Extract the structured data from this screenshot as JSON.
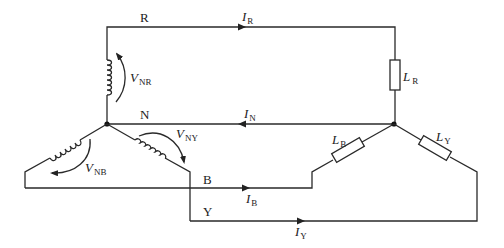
{
  "diagram": {
    "type": "three-phase star-connected supply with star-connected load and neutral",
    "lines": {
      "R": "R",
      "N": "N",
      "B": "B",
      "Y": "Y"
    },
    "currents": {
      "IR": {
        "main": "I",
        "sub": "R"
      },
      "IN": {
        "main": "I",
        "sub": "N"
      },
      "IB": {
        "main": "I",
        "sub": "B"
      },
      "IY": {
        "main": "I",
        "sub": "Y"
      }
    },
    "voltages": {
      "VNR": {
        "main": "V",
        "sub": "NR"
      },
      "VNY": {
        "main": "V",
        "sub": "NY"
      },
      "VNB": {
        "main": "V",
        "sub": "NB"
      }
    },
    "loads": {
      "LR": {
        "main": "L",
        "sub": "R"
      },
      "LB": {
        "main": "L",
        "sub": "B"
      },
      "LY": {
        "main": "L",
        "sub": "Y"
      }
    },
    "colors": {
      "wire": "#2a2a2a",
      "background": "#ffffff"
    }
  }
}
